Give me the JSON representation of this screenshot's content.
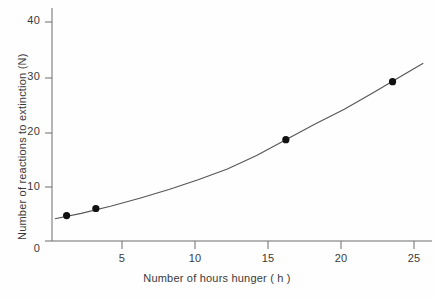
{
  "chart_data": {
    "type": "scatter",
    "title": "",
    "xlabel": "Number of hours hunger ( h )",
    "ylabel": "Number of reactions to extinction (N)",
    "xlim": [
      0,
      26
    ],
    "ylim": [
      0,
      43
    ],
    "xticks": [
      5,
      10,
      15,
      20,
      25
    ],
    "xtick_labels": [
      "5",
      "10",
      "15",
      "20",
      "25"
    ],
    "yticks": [
      0,
      10,
      20,
      30,
      40
    ],
    "ytick_labels": [
      "0",
      "10",
      "20",
      "30",
      "40"
    ],
    "grid": false,
    "legend": "none",
    "series": [
      {
        "name": "reactions to extinction",
        "marker": "filled-circle",
        "color": "#111111",
        "x": [
          1.0,
          3.0,
          16.0,
          23.3
        ],
        "y": [
          4.7,
          6.0,
          18.7,
          29.4
        ]
      },
      {
        "name": "fitted curve",
        "marker": "none",
        "color": "#555555",
        "x": [
          0.2,
          2.0,
          4.0,
          6.0,
          8.0,
          10.0,
          12.0,
          14.0,
          16.0,
          18.0,
          20.0,
          22.0,
          24.0,
          25.4
        ],
        "y": [
          4.1,
          5.1,
          6.4,
          7.9,
          9.5,
          11.3,
          13.3,
          15.8,
          18.7,
          21.6,
          24.3,
          27.4,
          30.6,
          32.8
        ]
      }
    ]
  },
  "axis": {
    "line_color": "#6d6d6d",
    "tick_color": "#6d6d6d"
  },
  "yticks_render": [
    {
      "label": "40",
      "top": 14,
      "tick_y": 22
    },
    {
      "label": "30",
      "top": 70,
      "tick_y": 78
    },
    {
      "label": "20",
      "top": 125,
      "tick_y": 133
    },
    {
      "label": "10",
      "top": 180,
      "tick_y": 187
    },
    {
      "label": "0",
      "top": 234,
      "tick_y": 241
    }
  ],
  "xticks_render": [
    {
      "label": "5",
      "left": 122
    },
    {
      "label": "10",
      "left": 195
    },
    {
      "label": "15",
      "left": 268
    },
    {
      "label": "20",
      "left": 341
    },
    {
      "label": "25",
      "left": 414
    }
  ]
}
